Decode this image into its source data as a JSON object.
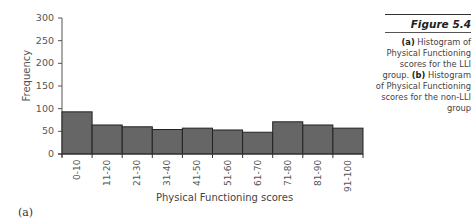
{
  "figure": {
    "number": "Figure 5.4",
    "panel_label": "(a)",
    "caption": {
      "a_marker": "(a)",
      "a_text": " Histogram of Physical Functioning scores for the LLI group. ",
      "b_marker": "(b)",
      "b_text": " Histogram of Physical Functioning scores for the non-LLI group"
    }
  },
  "chart_data": {
    "type": "bar",
    "title": "",
    "xlabel": "Physical Functioning scores",
    "ylabel": "Frequency",
    "ylim": [
      0,
      300
    ],
    "yticks": [
      0,
      50,
      100,
      150,
      200,
      250,
      300
    ],
    "grid": false,
    "legend": null,
    "categories": [
      "0-10",
      "11-20",
      "21-30",
      "31-40",
      "41-50",
      "51-60",
      "61-70",
      "71-80",
      "81-90",
      "91-100"
    ],
    "values": [
      93,
      64,
      60,
      54,
      57,
      53,
      48,
      71,
      64,
      57
    ],
    "bar_color": "#666666"
  }
}
